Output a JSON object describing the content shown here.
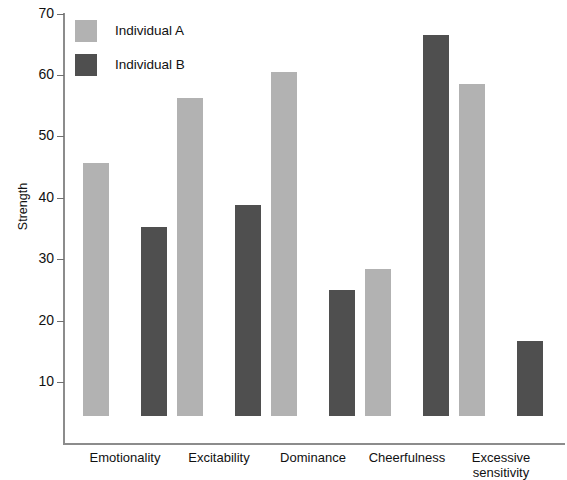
{
  "chart_data": {
    "type": "bar",
    "title": "",
    "xlabel": "",
    "ylabel": "Strength",
    "ylim": [
      0,
      70
    ],
    "yticks": [
      10,
      20,
      30,
      40,
      50,
      60,
      70
    ],
    "grid": false,
    "legend_position": "top-left",
    "categories": [
      "Emotionality",
      "Excitability",
      "Dominance",
      "Cheerfulness",
      "Excessive sensitivity"
    ],
    "series": [
      {
        "name": "Individual A",
        "color": "#b2b2b2",
        "values": [
          41.2,
          51.8,
          56.0,
          24.0,
          54.0
        ]
      },
      {
        "name": "Individual B",
        "color": "#4f4f4f",
        "values": [
          30.8,
          34.4,
          20.5,
          62.0,
          12.2
        ]
      }
    ]
  },
  "axis": {
    "y_title": "Strength",
    "tick_labels": [
      "70",
      "60",
      "50",
      "40",
      "30",
      "20",
      "10"
    ]
  },
  "legend": {
    "items": [
      {
        "label": "Individual A",
        "color": "#b2b2b2"
      },
      {
        "label": "Individual B",
        "color": "#4f4f4f"
      }
    ]
  },
  "category_labels": [
    {
      "line1": "Emotionality",
      "line2": ""
    },
    {
      "line1": "Excitability",
      "line2": ""
    },
    {
      "line1": "Dominance",
      "line2": ""
    },
    {
      "line1": "Cheerfulness",
      "line2": ""
    },
    {
      "line1": "Excessive",
      "line2": "sensitivity"
    }
  ],
  "colors": {
    "series_a": "#b2b2b2",
    "series_b": "#4f4f4f",
    "axis": "#8c8c8c",
    "text": "#111111",
    "background": "#ffffff"
  }
}
